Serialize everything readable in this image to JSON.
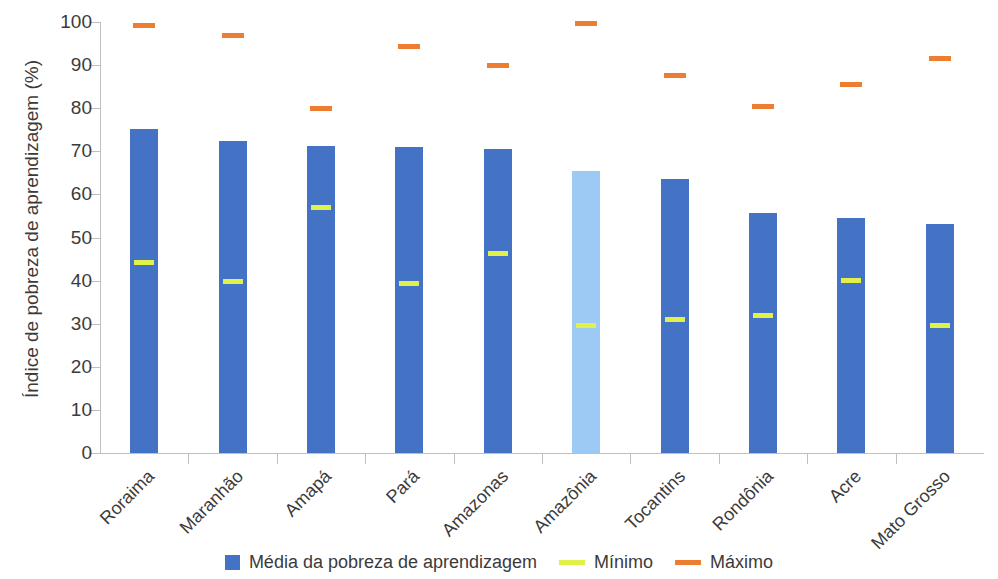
{
  "chart_data": {
    "type": "bar",
    "title": "",
    "subtitle": "",
    "xlabel": "",
    "ylabel": "Índice de pobreza de aprendizagem (%)",
    "ylim": [
      0,
      100
    ],
    "ytick_labels": [
      "0",
      "10",
      "20",
      "30",
      "40",
      "50",
      "60",
      "70",
      "80",
      "90",
      "100"
    ],
    "ytick_values": [
      0,
      10,
      20,
      30,
      40,
      50,
      60,
      70,
      80,
      90,
      100
    ],
    "grid": false,
    "legend_position": "bottom",
    "categories": [
      "Roraima",
      "Maranhão",
      "Amapá",
      "Pará",
      "Amazonas",
      "Amazônia",
      "Tocantins",
      "Rondônia",
      "Acre",
      "Mato Grosso"
    ],
    "series": [
      {
        "name": "Média da pobreza de aprendizagem",
        "type": "bar",
        "color": "#4472c4",
        "values": [
          75.2,
          72.4,
          71.2,
          71.1,
          70.5,
          65.4,
          63.5,
          55.7,
          54.6,
          53.1
        ]
      },
      {
        "name": "Mínimo",
        "type": "marker",
        "color": "#e2f04a",
        "values": [
          44.1,
          39.7,
          57.0,
          39.3,
          46.4,
          29.6,
          30.9,
          31.8,
          40.0,
          29.5
        ]
      },
      {
        "name": "Máximo",
        "type": "marker",
        "color": "#ed7d31",
        "values": [
          99.3,
          96.9,
          80.0,
          94.4,
          89.9,
          99.6,
          87.6,
          80.5,
          85.4,
          91.5
        ]
      }
    ],
    "highlight_category": "Amazônia",
    "highlight_color": "#9dc9f5"
  },
  "legend": {
    "items": [
      {
        "label": "Média da pobreza de aprendizagem",
        "swatch": "box",
        "color": "#4472c4"
      },
      {
        "label": "Mínimo",
        "swatch": "line",
        "color": "#e2f04a"
      },
      {
        "label": "Máximo",
        "swatch": "line",
        "color": "#ed7d31"
      }
    ]
  }
}
